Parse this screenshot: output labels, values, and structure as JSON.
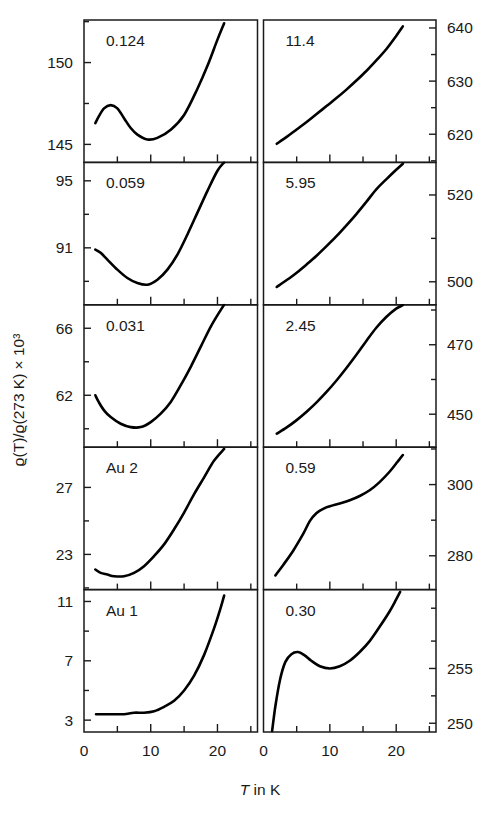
{
  "figure": {
    "ylabel": "ϱ(T)/ϱ(273 K) × 10³",
    "xlabel_italic": "T",
    "xlabel_rest": " in K"
  },
  "axes": {
    "x_ticks_major": [
      "0",
      "10",
      "20"
    ],
    "x_major_values": [
      0,
      10,
      20
    ],
    "x_minor_values": [
      5,
      15,
      25
    ],
    "x_range": [
      0,
      26
    ]
  },
  "chart_data": {
    "type": "line",
    "title": "",
    "xlabel": "T in K",
    "ylabel": "ϱ(T)/ϱ(273 K) × 10³",
    "grid": false,
    "legend": "none",
    "layout": {
      "rows": 5,
      "cols": 2,
      "shared_x": true,
      "left_column_axis": "left",
      "right_column_axis": "right"
    },
    "panels": [
      {
        "row": 1,
        "col": 1,
        "label": "0.124",
        "axis_side": "left",
        "ylim": [
          143.9,
          152.6
        ],
        "yticks_major": [
          145,
          150
        ],
        "yticks_major_labels": [
          "145",
          "150"
        ],
        "yticks_minor": [
          142.5,
          147.5,
          152.5
        ],
        "x": [
          1.7,
          2.2,
          3.0,
          4.0,
          5.0,
          6.0,
          7.0,
          8.0,
          9.5,
          11.0,
          13.0,
          15.0,
          17.0,
          18.5,
          20.0,
          21.0
        ],
        "y": [
          146.3,
          146.7,
          147.2,
          147.4,
          147.2,
          146.6,
          146.0,
          145.6,
          145.3,
          145.4,
          145.9,
          146.8,
          148.4,
          149.8,
          151.4,
          152.4
        ]
      },
      {
        "row": 2,
        "col": 1,
        "label": "0.059",
        "axis_side": "left",
        "ylim": [
          87.6,
          96.1
        ],
        "yticks_major": [
          91,
          95
        ],
        "yticks_major_labels": [
          "91",
          "95"
        ],
        "yticks_minor": [
          89,
          93
        ],
        "x": [
          1.7,
          2.5,
          3.5,
          5.0,
          6.5,
          8.0,
          9.5,
          11.0,
          12.5,
          14.0,
          15.5,
          17.0,
          18.5,
          20.0,
          21.0
        ],
        "y": [
          90.9,
          90.7,
          90.3,
          89.7,
          89.2,
          88.9,
          88.8,
          89.1,
          89.7,
          90.6,
          91.8,
          93.1,
          94.4,
          95.6,
          96.1
        ]
      },
      {
        "row": 3,
        "col": 1,
        "label": "0.031",
        "axis_side": "left",
        "ylim": [
          58.9,
          67.4
        ],
        "yticks_major": [
          62,
          66
        ],
        "yticks_major_labels": [
          "62",
          "66"
        ],
        "yticks_minor": [
          60,
          64
        ],
        "x": [
          1.7,
          2.2,
          3.0,
          4.0,
          5.5,
          7.0,
          8.5,
          10.0,
          11.5,
          13.0,
          14.5,
          16.0,
          17.5,
          19.0,
          20.5,
          21.0
        ],
        "y": [
          62.0,
          61.6,
          61.1,
          60.7,
          60.3,
          60.1,
          60.1,
          60.4,
          60.9,
          61.6,
          62.6,
          63.7,
          64.9,
          66.1,
          67.1,
          67.4
        ]
      },
      {
        "row": 4,
        "col": 1,
        "label": "Au 2",
        "axis_side": "left",
        "ylim": [
          20.9,
          29.4
        ],
        "yticks_major": [
          23,
          27
        ],
        "yticks_major_labels": [
          "23",
          "27"
        ],
        "yticks_minor": [
          21,
          25
        ],
        "x": [
          1.7,
          2.5,
          3.5,
          4.5,
          6.0,
          7.5,
          9.0,
          10.5,
          12.0,
          13.5,
          15.0,
          16.5,
          18.0,
          19.5,
          21.0
        ],
        "y": [
          22.1,
          21.9,
          21.8,
          21.7,
          21.7,
          21.9,
          22.3,
          22.9,
          23.6,
          24.5,
          25.5,
          26.6,
          27.6,
          28.6,
          29.3
        ]
      },
      {
        "row": 5,
        "col": 1,
        "label": "Au 1",
        "axis_side": "left",
        "ylim": [
          2.2,
          11.8
        ],
        "yticks_major": [
          3,
          7,
          11
        ],
        "yticks_major_labels": [
          "3",
          "7",
          "11"
        ],
        "yticks_minor": [
          5,
          9
        ],
        "x": [
          1.8,
          3.0,
          4.5,
          6.0,
          7.5,
          9.0,
          10.5,
          12.0,
          13.5,
          15.0,
          16.5,
          18.0,
          19.5,
          20.5,
          21.0
        ],
        "y": [
          3.4,
          3.4,
          3.4,
          3.4,
          3.5,
          3.5,
          3.6,
          3.9,
          4.3,
          5.0,
          6.0,
          7.4,
          9.2,
          10.6,
          11.4
        ]
      },
      {
        "row": 1,
        "col": 2,
        "label": "11.4",
        "axis_side": "right",
        "ylim": [
          614.7,
          641.5
        ],
        "yticks_major": [
          620,
          630,
          640
        ],
        "yticks_major_labels": [
          "620",
          "630",
          "640"
        ],
        "yticks_minor": [
          615,
          625,
          635
        ],
        "x": [
          2.0,
          3.5,
          5.0,
          6.5,
          8.0,
          9.5,
          11.0,
          12.5,
          14.0,
          15.5,
          17.0,
          18.5,
          20.0,
          21.0
        ],
        "y": [
          618.2,
          619.5,
          620.9,
          622.3,
          623.8,
          625.3,
          626.8,
          628.4,
          630.1,
          631.9,
          633.9,
          636.0,
          638.5,
          640.3
        ]
      },
      {
        "row": 2,
        "col": 2,
        "label": "5.95",
        "axis_side": "right",
        "ylim": [
          494.7,
          527.5
        ],
        "yticks_major": [
          500,
          520
        ],
        "yticks_major_labels": [
          "500",
          "520"
        ],
        "yticks_minor": [
          490,
          510,
          530
        ],
        "x": [
          2.0,
          3.5,
          5.0,
          6.5,
          8.0,
          9.5,
          11.0,
          12.5,
          14.0,
          15.5,
          17.0,
          18.5,
          20.0,
          21.0
        ],
        "y": [
          498.8,
          500.4,
          502.1,
          504.0,
          506.0,
          508.2,
          510.5,
          513.0,
          515.6,
          518.4,
          521.3,
          523.6,
          525.8,
          527.2
        ]
      },
      {
        "row": 3,
        "col": 2,
        "label": "2.45",
        "axis_side": "right",
        "ylim": [
          440.5,
          481.5
        ],
        "yticks_major": [
          450,
          470
        ],
        "yticks_major_labels": [
          "450",
          "470"
        ],
        "yticks_minor": [
          440,
          460,
          480
        ],
        "x": [
          2.0,
          3.5,
          5.0,
          6.5,
          8.0,
          9.5,
          11.0,
          12.5,
          14.0,
          15.5,
          17.0,
          18.5,
          20.0,
          21.0
        ],
        "y": [
          444.4,
          446.2,
          448.3,
          450.7,
          453.4,
          456.4,
          459.7,
          463.3,
          467.1,
          471.1,
          474.9,
          478.0,
          480.4,
          481.4
        ]
      },
      {
        "row": 4,
        "col": 2,
        "label": "0.59",
        "axis_side": "right",
        "ylim": [
          270.5,
          310.5
        ],
        "yticks_major": [
          280,
          300
        ],
        "yticks_major_labels": [
          "280",
          "300"
        ],
        "yticks_minor": [
          270,
          290,
          310
        ],
        "x": [
          1.8,
          3.0,
          4.5,
          6.0,
          7.0,
          8.0,
          9.0,
          10.0,
          11.5,
          13.0,
          14.5,
          16.0,
          17.5,
          19.0,
          20.2,
          21.0
        ],
        "y": [
          274.5,
          277.5,
          281.5,
          286.2,
          289.8,
          292.0,
          293.2,
          293.9,
          294.7,
          295.6,
          296.8,
          298.4,
          300.7,
          303.6,
          306.4,
          308.3
        ]
      },
      {
        "row": 5,
        "col": 2,
        "label": "0.30",
        "axis_side": "right",
        "ylim": [
          249.2,
          262.2
        ],
        "yticks_major": [
          250,
          255
        ],
        "yticks_major_labels": [
          "250",
          "255"
        ],
        "yticks_minor": [
          252.5,
          257.5,
          260.5
        ],
        "x": [
          1.3,
          1.8,
          2.5,
          3.3,
          4.2,
          5.2,
          6.2,
          7.2,
          8.5,
          10.0,
          11.5,
          13.0,
          14.5,
          16.0,
          17.5,
          19.0,
          20.0,
          20.6
        ],
        "y": [
          249.3,
          251.6,
          254.0,
          255.6,
          256.3,
          256.5,
          256.2,
          255.7,
          255.2,
          255.0,
          255.2,
          255.7,
          256.5,
          257.5,
          258.8,
          260.2,
          261.3,
          262.0
        ]
      }
    ]
  }
}
